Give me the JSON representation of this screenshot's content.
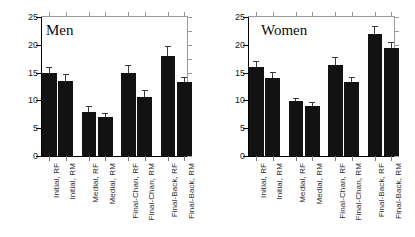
{
  "chart_data": [
    {
      "type": "bar",
      "title": "Men",
      "xlabel": "",
      "ylabel": "",
      "ylim": [
        0,
        25
      ],
      "yticks": [
        0,
        5,
        10,
        15,
        20,
        25
      ],
      "grid": false,
      "legend": "none",
      "categories": [
        "Initial, RF",
        "Initial, RM",
        "Medial, RF",
        "Medial, RM",
        "Final-Chan, RF",
        "Final-Chan, RM",
        "Final-Back, RF",
        "Final-Back, RM"
      ],
      "values": [
        14.9,
        13.5,
        8.0,
        7.0,
        14.9,
        10.6,
        17.9,
        13.3
      ],
      "errors": [
        1.0,
        1.1,
        0.9,
        0.6,
        1.2,
        1.1,
        1.7,
        0.8
      ],
      "error_direction": "up"
    },
    {
      "type": "bar",
      "title": "Women",
      "xlabel": "",
      "ylabel": "",
      "ylim": [
        0,
        25
      ],
      "yticks": [
        0,
        5,
        10,
        15,
        20,
        25
      ],
      "grid": false,
      "legend": "none",
      "categories": [
        "Initial, RF",
        "Initial, RM",
        "Medial, RF",
        "Medial, RM",
        "Final-Chan, RF",
        "Final-Chan, RM",
        "Final-Back, RF",
        "Final-Back, RM"
      ],
      "values": [
        16.0,
        14.1,
        9.9,
        9.0,
        16.3,
        13.4,
        22.0,
        19.4
      ],
      "errors": [
        0.9,
        0.8,
        0.4,
        0.5,
        1.3,
        0.7,
        1.2,
        1.0
      ],
      "error_direction": "up"
    }
  ]
}
